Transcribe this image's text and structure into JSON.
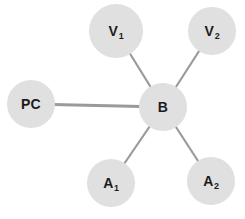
{
  "diagram": {
    "type": "star-topology-graph",
    "title": "",
    "background_color": "#ffffff",
    "node_fill_color": "#e0e0e0",
    "node_text_color": "#1c1c1c",
    "edge_color": "#9a9a9a",
    "nodes": [
      {
        "id": "PC",
        "label_main": "PC",
        "label_sub": "",
        "cx": 31,
        "cy": 104,
        "r": 24
      },
      {
        "id": "V1",
        "label_main": "V",
        "label_sub": "1",
        "cx": 116,
        "cy": 31,
        "r": 27
      },
      {
        "id": "V2",
        "label_main": "V",
        "label_sub": "2",
        "cx": 212,
        "cy": 31,
        "r": 24
      },
      {
        "id": "B",
        "label_main": "B",
        "label_sub": "",
        "cx": 163,
        "cy": 107,
        "r": 24
      },
      {
        "id": "A1",
        "label_main": "A",
        "label_sub": "1",
        "cx": 111,
        "cy": 183,
        "r": 24
      },
      {
        "id": "A2",
        "label_main": "A",
        "label_sub": "2",
        "cx": 211,
        "cy": 181,
        "r": 24
      }
    ],
    "edges": [
      {
        "id": "edge-pc-b",
        "from": "PC",
        "to": "B",
        "width": 3.2
      },
      {
        "id": "edge-v1-b",
        "from": "V1",
        "to": "B",
        "width": 2.2
      },
      {
        "id": "edge-v2-b",
        "from": "V2",
        "to": "B",
        "width": 2.2
      },
      {
        "id": "edge-a1-b",
        "from": "A1",
        "to": "B",
        "width": 2.2
      },
      {
        "id": "edge-a2-b",
        "from": "A2",
        "to": "B",
        "width": 2.2
      }
    ]
  }
}
